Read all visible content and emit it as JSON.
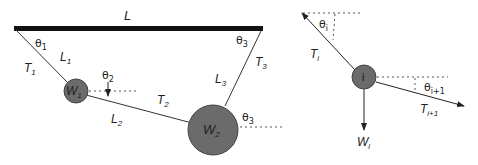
{
  "left_diagram": {
    "ceiling_label": "L",
    "segments": [
      {
        "length_label": "L",
        "length_sub": "1",
        "tension_label": "T",
        "tension_sub": "1",
        "angle_label": "θ",
        "angle_sub": "1"
      },
      {
        "length_label": "L",
        "length_sub": "2",
        "tension_label": "T",
        "tension_sub": "2",
        "angle_label": "θ",
        "angle_sub": "2"
      },
      {
        "length_label": "L",
        "length_sub": "3",
        "tension_label": "T",
        "tension_sub": "3",
        "angle_label": "θ",
        "angle_sub": "3"
      }
    ],
    "weights": [
      {
        "label": "W",
        "sub": "1"
      },
      {
        "label": "W",
        "sub": "2"
      }
    ],
    "angle_at_w2": {
      "label": "θ",
      "sub": "3"
    }
  },
  "right_diagram": {
    "node_label": "i",
    "tension_in": {
      "label": "T",
      "sub": "i"
    },
    "tension_out": {
      "label": "T",
      "sub": "i+1"
    },
    "angle_in": {
      "label": "θ",
      "sub": "i"
    },
    "angle_out": {
      "label": "θ",
      "sub": "i+1"
    },
    "weight": {
      "label": "W",
      "sub": "i"
    }
  },
  "colors": {
    "ceiling": "#111111",
    "mass_fill": "#6b6b6b",
    "mass_stroke": "#444444",
    "line": "#333333"
  }
}
